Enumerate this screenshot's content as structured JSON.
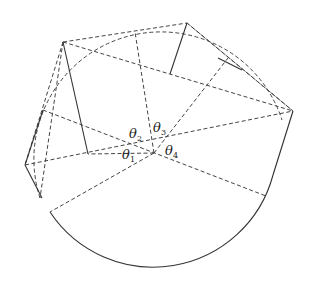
{
  "diagram": {
    "type": "geometric-construction",
    "labels": [
      {
        "id": "theta1",
        "symbol": "θ",
        "subscript": "1"
      },
      {
        "id": "theta2",
        "symbol": "θ",
        "subscript": "2"
      },
      {
        "id": "theta3",
        "symbol": "θ",
        "subscript": "3"
      },
      {
        "id": "theta4",
        "symbol": "θ",
        "subscript": "4"
      }
    ],
    "colors": {
      "stroke": "#333333",
      "background": "#ffffff"
    }
  }
}
